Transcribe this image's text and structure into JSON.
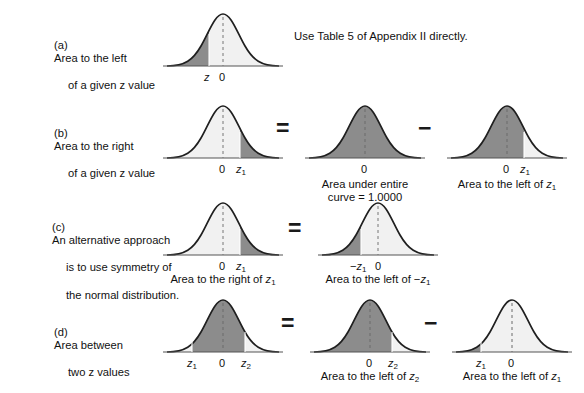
{
  "figure": {
    "colors": {
      "shaded": "#8c8c8c",
      "unshaded": "#f1f1f1",
      "curve_outline": "#1f1f1f",
      "axis": "#555555",
      "background": "#ffffff",
      "text": "#111111"
    },
    "note": "Use Table 5 of Appendix II directly."
  },
  "rows": [
    {
      "tag": "(a)",
      "label_line1": "Area to the left",
      "label_line2": "of a given z value",
      "curves": [
        {
          "name": "curve-a-1",
          "shading": "left-of-z",
          "ticks": [
            {
              "text": "z",
              "italic": true
            },
            {
              "text": "0",
              "italic": false
            }
          ],
          "caption": ""
        }
      ],
      "operators": []
    },
    {
      "tag": "(b)",
      "label_line1": "Area to the right",
      "label_line2": "of a given z value",
      "curves": [
        {
          "name": "curve-b-1",
          "shading": "right-of-z1",
          "ticks": [
            {
              "text": "0",
              "italic": false
            },
            {
              "text": "z1",
              "italic": true
            }
          ],
          "caption": ""
        },
        {
          "name": "curve-b-2",
          "shading": "full",
          "ticks": [
            {
              "text": "0",
              "italic": false
            }
          ],
          "caption": "Area under entire\ncurve = 1.0000"
        },
        {
          "name": "curve-b-3",
          "shading": "left-of-z1",
          "ticks": [
            {
              "text": "0",
              "italic": false
            },
            {
              "text": "z1",
              "italic": true
            }
          ],
          "caption": "Area to the left of z1"
        }
      ],
      "operators": [
        "=",
        "−"
      ]
    },
    {
      "tag": "(c)",
      "label_line1": "An alternative approach",
      "label_line2": "is to use symmetry of",
      "label_line3": "the normal distribution.",
      "curves": [
        {
          "name": "curve-c-1",
          "shading": "right-of-z1",
          "ticks": [
            {
              "text": "0",
              "italic": false
            },
            {
              "text": "z1",
              "italic": true
            }
          ],
          "caption": "Area to the right of z1"
        },
        {
          "name": "curve-c-2",
          "shading": "left-of-neg-z1",
          "ticks": [
            {
              "text": "-z1",
              "italic": true
            },
            {
              "text": "0",
              "italic": false
            }
          ],
          "caption": "Area to the left of -z1"
        }
      ],
      "operators": [
        "="
      ]
    },
    {
      "tag": "(d)",
      "label_line1": "Area between",
      "label_line2": "two z values",
      "curves": [
        {
          "name": "curve-d-1",
          "shading": "between-z1-z2",
          "ticks": [
            {
              "text": "z1",
              "italic": true
            },
            {
              "text": "0",
              "italic": false
            },
            {
              "text": "z2",
              "italic": true
            }
          ],
          "caption": ""
        },
        {
          "name": "curve-d-2",
          "shading": "left-of-z2",
          "ticks": [
            {
              "text": "0",
              "italic": false
            },
            {
              "text": "z2",
              "italic": true
            }
          ],
          "caption": "Area to the left of z2"
        },
        {
          "name": "curve-d-3",
          "shading": "left-of-z1-far",
          "ticks": [
            {
              "text": "z1",
              "italic": true
            },
            {
              "text": "0",
              "italic": false
            }
          ],
          "caption": "Area to the left of z1"
        }
      ],
      "operators": [
        "=",
        "−"
      ]
    }
  ]
}
